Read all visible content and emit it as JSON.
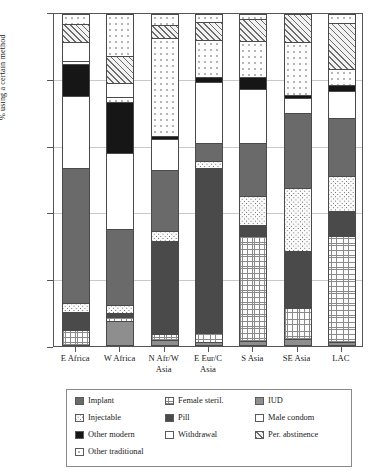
{
  "chart_data": {
    "type": "bar",
    "subtype": "stacked-bar-100",
    "title": "",
    "xlabel": "",
    "ylabel": "% using a certain method",
    "ylim": [
      0,
      100
    ],
    "yticks": [
      0,
      20,
      40,
      60,
      80,
      100
    ],
    "grid": true,
    "legend_position": "bottom",
    "categories": [
      "E Africa",
      "W Africa",
      "N Afr/W Asia",
      "E Eur/C Asia",
      "S Asia",
      "SE Asia",
      "LAC"
    ],
    "category_lines": [
      [
        "E Africa"
      ],
      [
        "W Africa"
      ],
      [
        "N Afr/W",
        "Asia"
      ],
      [
        "E Eur/C",
        "Asia"
      ],
      [
        "S Asia"
      ],
      [
        "SE Asia"
      ],
      [
        "LAC"
      ]
    ],
    "series": [
      {
        "name": "IUD",
        "pattern": "solid-gray",
        "values": [
          0.0,
          0.0,
          2.5,
          0.0,
          1.0,
          1.5,
          0.5
        ]
      },
      {
        "name": "Female steril.",
        "pattern": "fine-grid",
        "values": [
          4.5,
          7.0,
          0.5,
          3.5,
          32.0,
          11.0,
          32.0
        ]
      },
      {
        "name": "Pill",
        "pattern": "dark-solid",
        "values": [
          4.0,
          0.5,
          0.0,
          0.0,
          0.0,
          0.0,
          0.0
        ]
      },
      {
        "name": "Injectable",
        "pattern": "coarse-dots",
        "values": [
          1.5,
          3.5,
          28.0,
          0.0,
          3.0,
          16.0,
          7.5
        ]
      },
      {
        "name": "Implant",
        "pattern": "medium-gray",
        "values": [
          2.5,
          1.0,
          2.5,
          50.0,
          0.0,
          0.0,
          0.0
        ]
      },
      {
        "name": "Male condom",
        "pattern": "white",
        "values": [
          0.0,
          0.0,
          0.0,
          0.0,
          0.0,
          0.0,
          0.0
        ]
      },
      {
        "name": "Other modern",
        "pattern": "black",
        "values": [
          0.0,
          0.0,
          0.0,
          0.0,
          0.0,
          0.0,
          0.0
        ]
      },
      {
        "name": "Other traditional",
        "pattern": "sparse-dots",
        "values": [
          0.0,
          0.0,
          0.0,
          0.0,
          0.0,
          0.0,
          0.0
        ]
      },
      {
        "name": "Withdrawal",
        "pattern": "white-outline",
        "values": [
          0.0,
          0.0,
          0.0,
          0.0,
          0.0,
          0.0,
          0.0
        ]
      },
      {
        "name": "Per. abstinence",
        "pattern": "diagonal-hatch",
        "values": [
          0.0,
          0.0,
          0.0,
          0.0,
          0.0,
          0.0,
          0.0
        ]
      }
    ],
    "stacks": [
      {
        "category": "E Africa",
        "segments": [
          {
            "name": "IUD",
            "pattern": "p-iud",
            "from": 0,
            "to": 0
          },
          {
            "name": "Female steril.",
            "pattern": "p-fsteril",
            "from": 0,
            "to": 4.2
          },
          {
            "name": "Pill",
            "pattern": "p-pill",
            "from": 4.2,
            "to": 9.8
          },
          {
            "name": "Injectable",
            "pattern": "p-inject",
            "from": 9.8,
            "to": 12.3
          },
          {
            "name": "Implant",
            "pattern": "p-implant",
            "from": 12.3,
            "to": 53.4
          },
          {
            "name": "Male condom",
            "pattern": "p-condom",
            "from": 53.4,
            "to": 75.2
          },
          {
            "name": "Other modern",
            "pattern": "p-othermod",
            "from": 75.2,
            "to": 84.9
          },
          {
            "name": "Other traditional",
            "pattern": "p-othertrad",
            "from": 84.9,
            "to": 85.8
          },
          {
            "name": "Withdrawal",
            "pattern": "p-withdraw",
            "from": 85.8,
            "to": 91.5
          },
          {
            "name": "Per. abstinence",
            "pattern": "p-abst",
            "from": 91.5,
            "to": 97.0
          },
          {
            "name": "Other traditional (top)",
            "pattern": "p-othertrad",
            "from": 97.0,
            "to": 100
          }
        ]
      },
      {
        "category": "W Africa",
        "segments": [
          {
            "name": "IUD",
            "pattern": "p-iud",
            "from": 0,
            "to": 7.0
          },
          {
            "name": "Female steril.",
            "pattern": "p-fsteril",
            "from": 7.0,
            "to": 8.2
          },
          {
            "name": "Pill",
            "pattern": "p-pill",
            "from": 8.2,
            "to": 9.4
          },
          {
            "name": "Injectable",
            "pattern": "p-inject",
            "from": 9.4,
            "to": 11.8
          },
          {
            "name": "Implant",
            "pattern": "p-implant",
            "from": 11.8,
            "to": 35.0
          },
          {
            "name": "Male condom",
            "pattern": "p-condom",
            "from": 35.0,
            "to": 57.8
          },
          {
            "name": "Other modern",
            "pattern": "p-othermod",
            "from": 57.8,
            "to": 73.4
          },
          {
            "name": "Other traditional",
            "pattern": "p-othertrad",
            "from": 73.4,
            "to": 75.0
          },
          {
            "name": "Withdrawal",
            "pattern": "p-withdraw",
            "from": 75.0,
            "to": 79.1
          },
          {
            "name": "Per. abstinence",
            "pattern": "p-abst",
            "from": 79.1,
            "to": 87.4
          },
          {
            "name": "Other traditional (top)",
            "pattern": "p-othertrad",
            "from": 87.4,
            "to": 100
          }
        ]
      },
      {
        "category": "N Afr/W Asia",
        "segments": [
          {
            "name": "IUD",
            "pattern": "p-iud",
            "from": 0,
            "to": 1.3
          },
          {
            "name": "Female steril.",
            "pattern": "p-fsteril",
            "from": 1.3,
            "to": 3.0
          },
          {
            "name": "Pill",
            "pattern": "p-pill",
            "from": 3.0,
            "to": 31.2
          },
          {
            "name": "Injectable",
            "pattern": "p-inject",
            "from": 31.2,
            "to": 34.2
          },
          {
            "name": "Implant",
            "pattern": "p-implant",
            "from": 34.2,
            "to": 52.6
          },
          {
            "name": "Male condom",
            "pattern": "p-condom",
            "from": 52.6,
            "to": 62.0
          },
          {
            "name": "Other modern",
            "pattern": "p-othermod",
            "from": 62.0,
            "to": 63.0
          },
          {
            "name": "Other traditional",
            "pattern": "p-othertrad",
            "from": 63.0,
            "to": 92.6
          },
          {
            "name": "Per. abstinence",
            "pattern": "p-abst",
            "from": 92.6,
            "to": 96.6
          },
          {
            "name": "Other traditional (top)",
            "pattern": "p-othertrad",
            "from": 96.6,
            "to": 100
          }
        ]
      },
      {
        "category": "E Eur/C Asia",
        "segments": [
          {
            "name": "IUD",
            "pattern": "p-iud",
            "from": 0,
            "to": 0.6
          },
          {
            "name": "Female steril.",
            "pattern": "p-fsteril",
            "from": 0.6,
            "to": 3.4
          },
          {
            "name": "Pill",
            "pattern": "p-pill",
            "from": 3.4,
            "to": 53.2
          },
          {
            "name": "Injectable",
            "pattern": "p-inject",
            "from": 53.2,
            "to": 55.6
          },
          {
            "name": "Implant",
            "pattern": "p-implant",
            "from": 55.6,
            "to": 61.0
          },
          {
            "name": "Male condom",
            "pattern": "p-condom",
            "from": 61.0,
            "to": 79.4
          },
          {
            "name": "Other modern",
            "pattern": "p-othermod",
            "from": 79.4,
            "to": 81.0
          },
          {
            "name": "Other traditional",
            "pattern": "p-othertrad",
            "from": 81.0,
            "to": 92.0
          },
          {
            "name": "Per. abstinence",
            "pattern": "p-abst",
            "from": 92.0,
            "to": 97.6
          },
          {
            "name": "Other traditional (top)",
            "pattern": "p-othertrad",
            "from": 97.6,
            "to": 100
          }
        ]
      },
      {
        "category": "S Asia",
        "segments": [
          {
            "name": "IUD",
            "pattern": "p-iud",
            "from": 0,
            "to": 1.0
          },
          {
            "name": "Female steril.",
            "pattern": "p-fsteril",
            "from": 1.0,
            "to": 32.8
          },
          {
            "name": "Pill",
            "pattern": "p-pill",
            "from": 32.8,
            "to": 36.0
          },
          {
            "name": "Injectable",
            "pattern": "p-inject",
            "from": 36.0,
            "to": 45.0
          },
          {
            "name": "Implant",
            "pattern": "p-implant",
            "from": 45.0,
            "to": 61.0
          },
          {
            "name": "Male condom",
            "pattern": "p-condom",
            "from": 61.0,
            "to": 77.2
          },
          {
            "name": "Other modern",
            "pattern": "p-othermod",
            "from": 77.2,
            "to": 81.0
          },
          {
            "name": "Other traditional",
            "pattern": "p-othertrad",
            "from": 81.0,
            "to": 91.8
          },
          {
            "name": "Per. abstinence",
            "pattern": "p-abst",
            "from": 91.8,
            "to": 98.6
          },
          {
            "name": "Other traditional (top)",
            "pattern": "p-othertrad",
            "from": 98.6,
            "to": 100
          }
        ]
      },
      {
        "category": "SE Asia",
        "segments": [
          {
            "name": "IUD",
            "pattern": "p-iud",
            "from": 0,
            "to": 1.4
          },
          {
            "name": "Female steril.",
            "pattern": "p-fsteril",
            "from": 1.4,
            "to": 11.0
          },
          {
            "name": "Pill",
            "pattern": "p-pill",
            "from": 11.0,
            "to": 28.2
          },
          {
            "name": "Injectable",
            "pattern": "p-inject",
            "from": 28.2,
            "to": 47.4
          },
          {
            "name": "Implant",
            "pattern": "p-implant",
            "from": 47.4,
            "to": 70.0
          },
          {
            "name": "Male condom",
            "pattern": "p-condom",
            "from": 70.0,
            "to": 74.4
          },
          {
            "name": "Other modern",
            "pattern": "p-othermod",
            "from": 74.4,
            "to": 75.4
          },
          {
            "name": "Other traditional",
            "pattern": "p-othertrad",
            "from": 75.4,
            "to": 91.4
          },
          {
            "name": "Per. abstinence",
            "pattern": "p-abst",
            "from": 91.4,
            "to": 100
          }
        ]
      },
      {
        "category": "LAC",
        "segments": [
          {
            "name": "IUD",
            "pattern": "p-iud",
            "from": 0,
            "to": 0.6
          },
          {
            "name": "Female steril.",
            "pattern": "p-fsteril",
            "from": 0.6,
            "to": 32.6
          },
          {
            "name": "Pill",
            "pattern": "p-pill",
            "from": 32.6,
            "to": 40.2
          },
          {
            "name": "Injectable",
            "pattern": "p-inject",
            "from": 40.2,
            "to": 50.8
          },
          {
            "name": "Implant",
            "pattern": "p-implant",
            "from": 50.8,
            "to": 68.4
          },
          {
            "name": "Male condom",
            "pattern": "p-condom",
            "from": 68.4,
            "to": 76.8
          },
          {
            "name": "Other modern",
            "pattern": "p-othermod",
            "from": 76.8,
            "to": 78.4
          },
          {
            "name": "Other traditional",
            "pattern": "p-othertrad",
            "from": 78.4,
            "to": 83.4
          },
          {
            "name": "Per. abstinence",
            "pattern": "p-abst",
            "from": 83.4,
            "to": 97.4
          },
          {
            "name": "Other traditional (top)",
            "pattern": "p-othertrad",
            "from": 97.4,
            "to": 100
          }
        ]
      }
    ],
    "legend": [
      {
        "label": "Implant",
        "pattern": "p-implant",
        "col": 0,
        "row": 0
      },
      {
        "label": "Injectable",
        "pattern": "p-inject",
        "col": 0,
        "row": 1
      },
      {
        "label": "Other modern",
        "pattern": "p-othermod",
        "col": 0,
        "row": 2
      },
      {
        "label": "Other traditional",
        "pattern": "p-othertrad",
        "col": 0,
        "row": 3
      },
      {
        "label": "Female steril.",
        "pattern": "p-fsteril",
        "col": 1,
        "row": 0
      },
      {
        "label": "Pill",
        "pattern": "p-pill",
        "col": 1,
        "row": 1
      },
      {
        "label": "Withdrawal",
        "pattern": "p-withdraw",
        "col": 1,
        "row": 2
      },
      {
        "label": "IUD",
        "pattern": "p-iud",
        "col": 2,
        "row": 0
      },
      {
        "label": "Male condom",
        "pattern": "p-condom",
        "col": 2,
        "row": 1
      },
      {
        "label": "Per. abstinence",
        "pattern": "p-abst",
        "col": 2,
        "row": 2
      }
    ]
  }
}
